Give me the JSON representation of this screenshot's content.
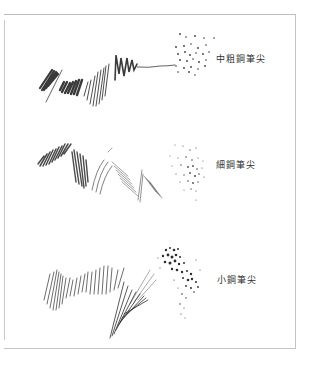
{
  "figure": {
    "samples": [
      {
        "id": "medium-coarse",
        "label": "中粗鋼筆尖",
        "stroke_color": "#3a3a3a"
      },
      {
        "id": "fine",
        "label": "細鋼筆尖",
        "stroke_color": "#4a4a4a"
      },
      {
        "id": "small",
        "label": "小鋼筆尖",
        "stroke_color": "#2e2e2e"
      }
    ]
  }
}
